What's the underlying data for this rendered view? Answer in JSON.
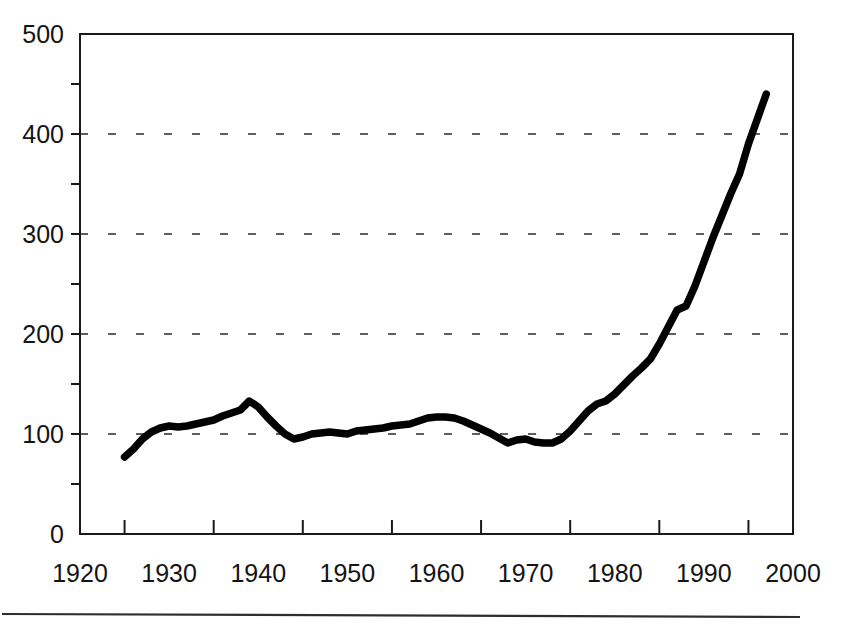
{
  "chart_data": {
    "type": "line",
    "title": "",
    "subtitle": "",
    "xlabel": "",
    "ylabel": "",
    "xlim": [
      1920,
      2000
    ],
    "ylim": [
      0,
      500
    ],
    "grid": true,
    "grid_axis": "y",
    "grid_style": "dashed",
    "legend": false,
    "legend_position": "none",
    "x_tick_labels": [
      "1920",
      "1930",
      "1940",
      "1950",
      "1960",
      "1970",
      "1980",
      "1990",
      "2000"
    ],
    "x_tick_values": [
      1920,
      1930,
      1940,
      1950,
      1960,
      1970,
      1980,
      1990,
      2000
    ],
    "x_minor_tick_values": [
      1925,
      1935,
      1945,
      1955,
      1965,
      1975,
      1985,
      1995
    ],
    "y_tick_labels": [
      "0",
      "100",
      "200",
      "300",
      "400",
      "500"
    ],
    "y_tick_values": [
      0,
      100,
      200,
      300,
      400,
      500
    ],
    "y_minor_tick_values": [
      50,
      150,
      250,
      350,
      450
    ],
    "y_gridline_values": [
      100,
      200,
      300,
      400
    ],
    "series": [
      {
        "name": "series-1",
        "color": "#000000",
        "x": [
          1925,
          1926,
          1927,
          1928,
          1929,
          1930,
          1931,
          1932,
          1933,
          1934,
          1935,
          1936,
          1937,
          1938,
          1939,
          1940,
          1941,
          1942,
          1943,
          1944,
          1945,
          1946,
          1947,
          1948,
          1949,
          1950,
          1951,
          1952,
          1953,
          1954,
          1955,
          1956,
          1957,
          1958,
          1959,
          1960,
          1961,
          1962,
          1963,
          1964,
          1965,
          1966,
          1967,
          1968,
          1969,
          1970,
          1971,
          1972,
          1973,
          1974,
          1975,
          1976,
          1977,
          1978,
          1979,
          1980,
          1981,
          1982,
          1983,
          1984,
          1985,
          1986,
          1987,
          1988,
          1989,
          1990,
          1991,
          1992,
          1993,
          1994,
          1995,
          1996,
          1997
        ],
        "y": [
          77,
          85,
          95,
          102,
          106,
          108,
          107,
          108,
          110,
          112,
          114,
          118,
          121,
          124,
          133,
          127,
          117,
          108,
          100,
          95,
          97,
          100,
          101,
          102,
          101,
          100,
          103,
          104,
          105,
          106,
          108,
          109,
          110,
          113,
          116,
          117,
          117,
          116,
          113,
          109,
          105,
          101,
          96,
          91,
          94,
          95,
          92,
          91,
          91,
          95,
          103,
          113,
          123,
          130,
          133,
          140,
          149,
          158,
          166,
          175,
          190,
          207,
          224,
          228,
          248,
          272,
          296,
          318,
          340,
          360,
          390,
          415,
          440
        ]
      }
    ]
  },
  "footer": {
    "rule_visible": true
  }
}
